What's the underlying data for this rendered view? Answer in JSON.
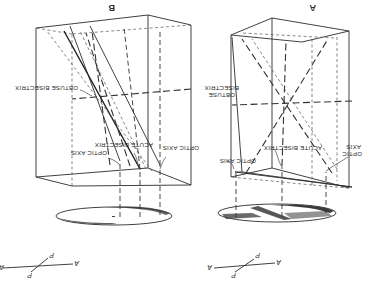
{
  "figure": {
    "orientation": "rotated 180 degrees",
    "panels": [
      {
        "id": "A",
        "label": "A",
        "annotations": {
          "obtuse_bisectrix_line1": "OBTUSE",
          "obtuse_bisectrix_line2": "BISECTRIX",
          "optic_axis_left": "OPTIC AXIS",
          "acute_bisectrix": "ACUTE BISECTRIX",
          "optic_axis_right_line1": "OPTIC",
          "optic_axis_right_line2": "AXIS"
        },
        "polarizer": {
          "analyzer_left": "A",
          "analyzer_right": "A",
          "polarizer_top": "P",
          "polarizer_bottom": "P"
        }
      },
      {
        "id": "B",
        "label": "B",
        "annotations": {
          "obtuse_bisectrix": "OBTUSE BISECTRIX",
          "optic_axis_left": "OPTIC AXIS",
          "acute_bisectrix": "ACUTE BISECTRIX",
          "optic_axis_right": "OPTIC AXIS"
        },
        "polarizer": {
          "analyzer_left": "A",
          "analyzer_right": "A",
          "polarizer_top": "P",
          "polarizer_bottom": "P"
        }
      }
    ]
  }
}
